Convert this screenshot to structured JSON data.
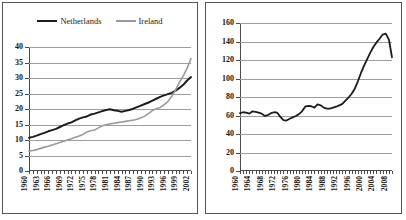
{
  "figure": {
    "panels": [
      "left-chart-panel",
      "right-chart-panel"
    ],
    "background": "#ffffff"
  },
  "chart_data": [
    {
      "id": "left",
      "type": "line",
      "title": "",
      "xlabel": "",
      "ylabel": "",
      "xlim": [
        1960,
        2002
      ],
      "ylim": [
        0,
        40
      ],
      "yticks": [
        0,
        5,
        10,
        15,
        20,
        25,
        30,
        35,
        40
      ],
      "xticks": [
        1960,
        1963,
        1966,
        1969,
        1972,
        1975,
        1978,
        1981,
        1984,
        1987,
        1990,
        1993,
        1996,
        1999,
        2002
      ],
      "grid": true,
      "legend_position": "top-center",
      "legend": [
        "Netherlands",
        "Ireland"
      ],
      "colors": {
        "Netherlands": "#1c1c1c",
        "Ireland": "#9a9a9a"
      },
      "x": [
        1960,
        1961,
        1962,
        1963,
        1964,
        1965,
        1966,
        1967,
        1968,
        1969,
        1970,
        1971,
        1972,
        1973,
        1974,
        1975,
        1976,
        1977,
        1978,
        1979,
        1980,
        1981,
        1982,
        1983,
        1984,
        1985,
        1986,
        1987,
        1988,
        1989,
        1990,
        1991,
        1992,
        1993,
        1994,
        1995,
        1996,
        1997,
        1998,
        1999,
        2000,
        2001,
        2002
      ],
      "series": [
        {
          "name": "Netherlands",
          "color": "#1c1c1c",
          "values": [
            10.7,
            11.0,
            11.4,
            11.9,
            12.3,
            12.8,
            13.2,
            13.6,
            14.2,
            14.8,
            15.3,
            15.7,
            16.3,
            16.9,
            17.3,
            17.6,
            18.2,
            18.5,
            18.9,
            19.3,
            19.7,
            19.9,
            19.6,
            19.4,
            19.1,
            19.4,
            19.7,
            20.1,
            20.6,
            21.1,
            21.6,
            22.1,
            22.7,
            23.3,
            23.9,
            24.4,
            24.8,
            25.2,
            25.9,
            26.8,
            27.8,
            29.2,
            30.3
          ]
        },
        {
          "name": "Ireland",
          "color": "#9a9a9a",
          "values": [
            6.4,
            6.6,
            6.9,
            7.3,
            7.7,
            8.0,
            8.4,
            8.8,
            9.2,
            9.6,
            10.0,
            10.4,
            10.9,
            11.3,
            11.8,
            12.6,
            13.0,
            13.2,
            13.9,
            14.6,
            14.9,
            15.2,
            15.4,
            15.6,
            15.8,
            16.0,
            16.2,
            16.4,
            16.7,
            17.2,
            17.7,
            18.6,
            19.5,
            20.1,
            20.5,
            21.3,
            22.4,
            24.0,
            26.2,
            28.6,
            30.7,
            33.2,
            36.3
          ]
        }
      ]
    },
    {
      "id": "right",
      "type": "line",
      "title": "",
      "xlabel": "",
      "ylabel": "",
      "xlim": [
        1960,
        2009
      ],
      "ylim": [
        0,
        160
      ],
      "yticks": [
        0,
        20,
        40,
        60,
        80,
        100,
        120,
        140,
        160
      ],
      "xticks": [
        1960,
        1964,
        1968,
        1972,
        1976,
        1980,
        1984,
        1988,
        1992,
        1996,
        2000,
        2004,
        2008
      ],
      "grid": true,
      "legend_position": "none",
      "legend": [],
      "colors": {
        "series1": "#1c1c1c"
      },
      "x": [
        1960,
        1961,
        1962,
        1963,
        1964,
        1965,
        1966,
        1967,
        1968,
        1969,
        1970,
        1971,
        1972,
        1973,
        1974,
        1975,
        1976,
        1977,
        1978,
        1979,
        1980,
        1981,
        1982,
        1983,
        1984,
        1985,
        1986,
        1987,
        1988,
        1989,
        1990,
        1991,
        1992,
        1993,
        1994,
        1995,
        1996,
        1997,
        1998,
        1999,
        2000,
        2001,
        2002,
        2003,
        2004,
        2005,
        2006,
        2007,
        2008,
        2009
      ],
      "series": [
        {
          "name": "series1",
          "color": "#1c1c1c",
          "values": [
            62.5,
            63.5,
            63.0,
            62.0,
            64.5,
            64.0,
            63.0,
            62.0,
            59.5,
            60.5,
            62.5,
            63.5,
            63.0,
            58.5,
            55.0,
            54.5,
            56.5,
            58.0,
            59.5,
            61.5,
            64.5,
            69.5,
            70.5,
            70.0,
            68.5,
            72.0,
            71.0,
            68.5,
            67.5,
            67.5,
            68.5,
            69.5,
            71.0,
            72.5,
            76.0,
            79.5,
            83.5,
            89.0,
            97.0,
            106.0,
            114.0,
            121.0,
            128.0,
            134.0,
            139.0,
            143.0,
            147.5,
            148.5,
            142.0,
            123.0
          ]
        }
      ]
    }
  ]
}
